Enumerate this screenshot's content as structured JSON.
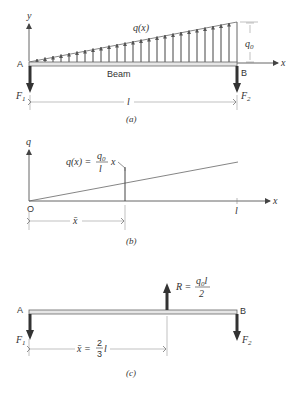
{
  "panel_a": {
    "caption": "(a)",
    "y_axis_label": "y",
    "x_axis_label": "x",
    "load_label": "q(x)",
    "max_load_label_base": "q",
    "max_load_label_sub": "0",
    "beam_label": "Beam",
    "left_support": "A",
    "right_support": "B",
    "left_force_base": "F",
    "left_force_sub": "1",
    "right_force_base": "F",
    "right_force_sub": "2",
    "length_label": "l"
  },
  "panel_b": {
    "caption": "(b)",
    "y_axis_label": "q",
    "x_axis_label": "x",
    "origin_label": "O",
    "equation_lhs": "q(x) =",
    "equation_num": "q",
    "equation_num_sub": "0",
    "equation_den": "l",
    "equation_var": "x",
    "xbar_label": "x̄",
    "length_label": "l"
  },
  "panel_c": {
    "caption": "(c)",
    "left_support": "A",
    "right_support": "B",
    "resultant_lhs": "R =",
    "resultant_num": "q",
    "resultant_num_sub": "0",
    "resultant_num_tail": "l",
    "resultant_den": "2",
    "left_force_base": "F",
    "left_force_sub": "1",
    "right_force_base": "F",
    "right_force_sub": "2",
    "xbar_lhs": "x̄ =",
    "xbar_num": "2",
    "xbar_den": "3",
    "xbar_tail": "l"
  },
  "colors": {
    "line": "#555555",
    "force_arrow": "#333333",
    "beam_fill": "#e6e6e6"
  }
}
